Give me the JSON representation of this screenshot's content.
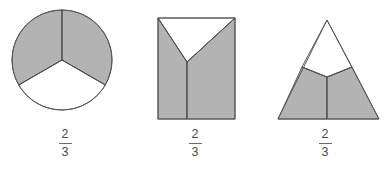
{
  "page": {
    "background_color": "#ffffff"
  },
  "style": {
    "shaded_fill": "#b3b3b3",
    "unshaded_fill": "#ffffff",
    "outline_color": "#5a5a5a",
    "label_color": "#4a4a4a"
  },
  "figures": [
    {
      "id": "circle",
      "shape_name": "circle-thirds",
      "shape_label": "Circle divided into three equal sectors",
      "shaded_parts": 2,
      "total_parts": 3,
      "fraction": {
        "numerator": "2",
        "denominator": "3"
      }
    },
    {
      "id": "square",
      "shape_name": "rectangle-thirds",
      "shape_label": "Rectangle divided into three equal parts with a V notch",
      "shaded_parts": 2,
      "total_parts": 3,
      "fraction": {
        "numerator": "2",
        "denominator": "3"
      }
    },
    {
      "id": "triangle",
      "shape_name": "triangle-thirds",
      "shape_label": "Triangle divided into three equal parts",
      "shaded_parts": 2,
      "total_parts": 3,
      "fraction": {
        "numerator": "2",
        "denominator": "3"
      }
    }
  ]
}
